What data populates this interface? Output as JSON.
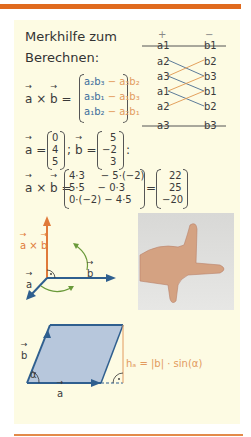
{
  "header": {
    "title_line1": "Merkhilfe zum",
    "title_line2": "Berechnen:"
  },
  "scheme": {
    "plus": "+",
    "minus": "−",
    "left": [
      "a1",
      "a2",
      "a3",
      "a1",
      "a2",
      "a3"
    ],
    "right": [
      "b1",
      "b2",
      "b3",
      "b1",
      "b2",
      "b3"
    ]
  },
  "formula": {
    "lhs_a": "a",
    "times": "×",
    "lhs_b": "b",
    "eq": "=",
    "rows": [
      {
        "pos": "a₂b₃",
        "neg": " − a₃b₂"
      },
      {
        "pos": "a₃b₁",
        "neg": " − a₁b₃"
      },
      {
        "pos": "a₁b₂",
        "neg": " − a₂b₁"
      }
    ]
  },
  "example": {
    "a_label": "a",
    "a_values": [
      "0",
      "4",
      "5"
    ],
    "b_label": "b",
    "b_values": [
      "5",
      "−2",
      "3"
    ],
    "sep": ";",
    "end": ":",
    "calc_rows": [
      "4·3     − 5·(−2)",
      "5·5    − 0·3",
      "0·(−2) − 4·5"
    ],
    "result": [
      "22",
      "25",
      "−20"
    ]
  },
  "diagram1": {
    "label_cross": "a × b",
    "label_a": "a",
    "label_b": "b"
  },
  "diagram2": {
    "label_a": "a",
    "label_b": "b",
    "label_alpha": "α",
    "label_h": "hₐ = |b| · sin(α)"
  },
  "colors": {
    "accent": "#e06a1e",
    "blue": "#2f5f8f",
    "orange": "#e29a5e",
    "background": "#fdfbe3",
    "parallelogram": "#b7c7dc"
  }
}
